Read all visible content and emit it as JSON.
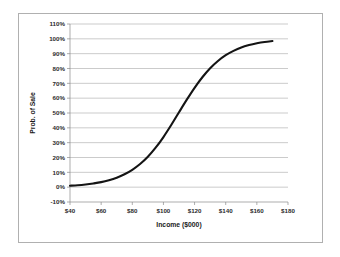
{
  "chart_data": {
    "type": "line",
    "title": "",
    "xlabel": "Income ($000)",
    "ylabel": "Prob. of Sale",
    "xlim": [
      40,
      180
    ],
    "ylim": [
      -10,
      110
    ],
    "grid": true,
    "legend": false,
    "x_tick_labels": [
      "$40",
      "$60",
      "$80",
      "$100",
      "$120",
      "$140",
      "$160",
      "$180"
    ],
    "x_ticks": [
      40,
      60,
      80,
      100,
      120,
      140,
      160,
      180
    ],
    "y_tick_labels": [
      "110%",
      "100%",
      "90%",
      "80%",
      "70%",
      "60%",
      "50%",
      "40%",
      "30%",
      "20%",
      "10%",
      "0%",
      "-10%"
    ],
    "y_ticks": [
      110,
      100,
      90,
      80,
      70,
      60,
      50,
      40,
      30,
      20,
      10,
      0,
      -10
    ],
    "series": [
      {
        "name": "Prob. of Sale",
        "color": "#141414",
        "x": [
          40,
          45,
          50,
          55,
          60,
          65,
          70,
          75,
          80,
          85,
          90,
          95,
          100,
          105,
          110,
          115,
          120,
          125,
          130,
          135,
          140,
          145,
          150,
          155,
          160,
          165,
          170
        ],
        "values": [
          1,
          1.3,
          1.8,
          2.5,
          3.4,
          4.7,
          6.4,
          8.7,
          11.7,
          15.6,
          20.5,
          26.6,
          33.8,
          41.9,
          50.5,
          59.0,
          67.0,
          74.1,
          80.2,
          85.1,
          89.0,
          91.9,
          94.2,
          95.8,
          97.0,
          97.9,
          98.5
        ]
      }
    ]
  }
}
